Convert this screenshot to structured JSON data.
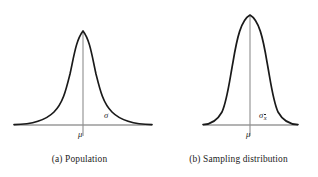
{
  "figure": {
    "background_color": "#ffffff",
    "curve_color": "#1a1a1a",
    "axis_color": "#9a9a9a",
    "text_color": "#1b1b1b"
  },
  "panels": [
    {
      "id": "a",
      "caption": "(a)  Population",
      "center_label": "μ",
      "spread_label": "σ",
      "spread_subscript": "",
      "baseline_y": 125,
      "baseline_x_start": 14,
      "baseline_x_end": 152,
      "peak_x": 83,
      "peak_y": 31,
      "curve_path": "M 14 124.6 C 30 124.4 44 122 54 112 C 63 103 66 90 70 74 C 74 56 76 40 83 31 C 90 40 92 56 96 74 C 100 90 103 103 112 112 C 122 122 136 124.4 152 124.6",
      "center_line_y_top": 31,
      "center_line_y_bottom": 136,
      "spread_label_x": 104,
      "spread_label_y": 110
    },
    {
      "id": "b",
      "caption": "(b)  Sampling distribution",
      "center_label": "μ",
      "spread_label": "σ",
      "spread_subscript": "x̄",
      "baseline_y": 125,
      "baseline_x_start": 203,
      "baseline_x_end": 298,
      "peak_x": 250,
      "peak_y": 15,
      "curve_path": "M 203 124.6 C 211 124.4 217 121 222 112 C 227 101 229 84 233 62 C 237 38 241 20 250 15 C 259 20 263 38 267 62 C 271 84 273 101 278 112 C 283 121 289 124.4 298 124.6",
      "center_line_y_top": 15,
      "center_line_y_bottom": 136,
      "spread_label_x": 259,
      "spread_label_y": 110
    }
  ],
  "chart_data": {
    "type": "line",
    "title": "",
    "subtitle": "",
    "xlabel": "",
    "ylabel": "",
    "grid": false,
    "legend": null,
    "series": [
      {
        "name": "(a)  Population",
        "mean": 0,
        "sd": 1,
        "peak_height": 1.0,
        "half_width_at_base": 1.0,
        "annotations": [
          {
            "text": "μ",
            "position": "below-center-axis"
          },
          {
            "text": "σ",
            "position": "right-of-center-above-axis"
          }
        ]
      },
      {
        "name": "(b)  Sampling distribution",
        "mean": 0,
        "sd": 0.63,
        "peak_height": 1.59,
        "half_width_at_base": 0.63,
        "annotations": [
          {
            "text": "μ",
            "position": "below-center-axis"
          },
          {
            "text": "σ x̄",
            "position": "right-of-center-above-axis"
          }
        ]
      }
    ]
  }
}
